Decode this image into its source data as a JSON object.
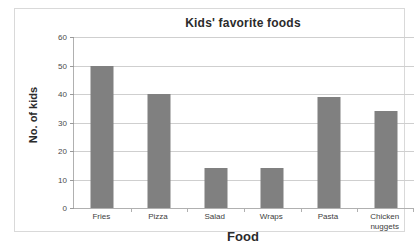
{
  "chart_data": {
    "type": "bar",
    "title": "Kids' favorite foods",
    "xlabel": "Food",
    "ylabel": "No. of kids",
    "categories": [
      "Fries",
      "Pizza",
      "Salad",
      "Wraps",
      "Pasta",
      "Chicken nuggets"
    ],
    "values": [
      50,
      40,
      14,
      14,
      39,
      34
    ],
    "ylim": [
      0,
      60
    ],
    "yticks": [
      0,
      10,
      20,
      30,
      40,
      50,
      60
    ],
    "ytick_labels": [
      "0",
      "10",
      "20",
      "30",
      "40",
      "50",
      "60"
    ],
    "grid": true,
    "legend": false,
    "bar_color": "#808080",
    "gridline_color": "#cfcfcf",
    "axis_color": "#b0b0b0",
    "text_color": "#2b2b2b"
  }
}
